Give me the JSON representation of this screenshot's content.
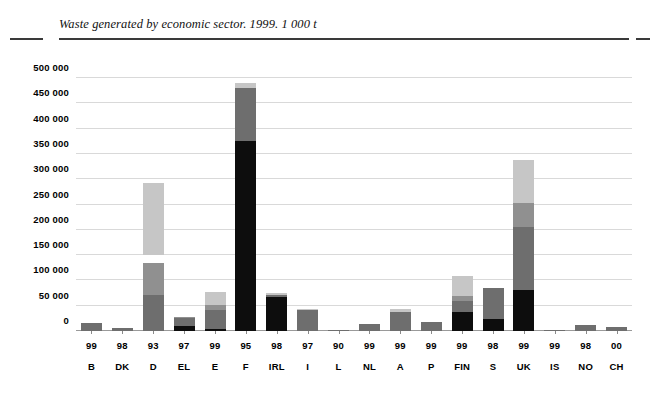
{
  "title": "Waste generated by economic sector. 1999. 1 000 t",
  "chart_data": {
    "type": "bar",
    "title": "Waste generated by economic sector. 1999. 1 000 t",
    "subtitle": "",
    "xlabel": "",
    "ylabel": "1 000 t",
    "stacked": true,
    "grid": true,
    "legend_position": "none",
    "ylim": [
      0,
      500000
    ],
    "yticks": [
      0,
      50000,
      100000,
      150000,
      200000,
      250000,
      300000,
      350000,
      400000,
      450000,
      500000
    ],
    "ytick_labels": [
      "0",
      "50 000",
      "100 000",
      "150 000",
      "200 000",
      "250 000",
      "300 000",
      "350 000",
      "400 000",
      "450 000",
      "500 000"
    ],
    "categories": [
      "B",
      "DK",
      "D",
      "EL",
      "E",
      "F",
      "IRL",
      "I",
      "L",
      "NL",
      "A",
      "P",
      "FIN",
      "S",
      "UK",
      "IS",
      "NO",
      "CH"
    ],
    "category_years": [
      "99",
      "98",
      "93",
      "97",
      "99",
      "95",
      "98",
      "97",
      "90",
      "99",
      "99",
      "99",
      "99",
      "98",
      "99",
      "99",
      "98",
      "00"
    ],
    "series": [
      {
        "name": "segment-1",
        "color": "#0d0d0d",
        "values": [
          0,
          0,
          0,
          9000,
          4000,
          375000,
          68000,
          0,
          0,
          0,
          0,
          0,
          38000,
          23000,
          82000,
          0,
          0,
          0
        ]
      },
      {
        "name": "segment-2",
        "color": "#6e6e6e",
        "values": [
          16000,
          5000,
          72000,
          16000,
          37000,
          105000,
          3000,
          41000,
          2000,
          14000,
          37000,
          17000,
          22000,
          62000,
          123000,
          1000,
          12000,
          8000
        ]
      },
      {
        "name": "segment-3",
        "color": "#909090",
        "values": [
          0,
          0,
          62000,
          3000,
          10000,
          0,
          0,
          0,
          0,
          0,
          0,
          0,
          10000,
          0,
          48000,
          0,
          0,
          0
        ]
      },
      {
        "name": "segment-4",
        "color": "#c6c6c6",
        "values": [
          0,
          0,
          142000,
          0,
          26000,
          10000,
          4000,
          2000,
          0,
          0,
          7000,
          0,
          38000,
          0,
          85000,
          0,
          0,
          0
        ]
      }
    ],
    "totals": [
      16000,
      5000,
      292000,
      28000,
      77000,
      490000,
      75000,
      43000,
      2000,
      14000,
      44000,
      17000,
      108000,
      85000,
      338000,
      1000,
      12000,
      8000
    ]
  },
  "colors": {
    "segment_black": "#0d0d0d",
    "segment_dark_gray": "#6e6e6e",
    "segment_mid_gray": "#909090",
    "segment_light_gray": "#c6c6c6",
    "gridline": "#d9d9d9",
    "axis": "#9a9a9a",
    "rule": "#3a3a3a",
    "background": "#ffffff",
    "text": "#000000"
  }
}
